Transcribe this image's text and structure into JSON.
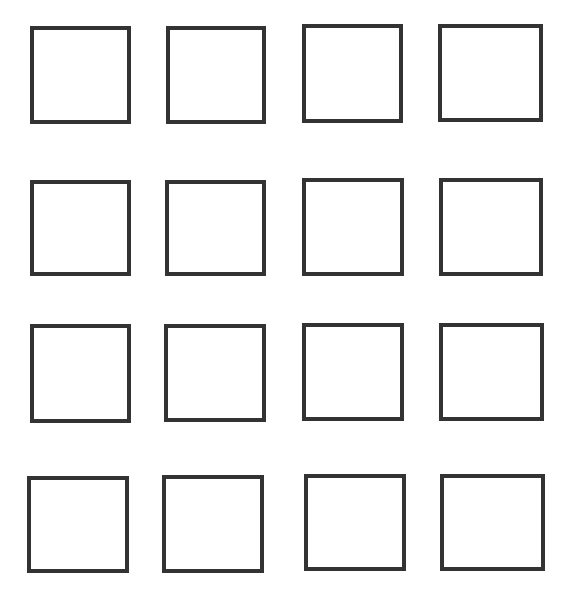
{
  "canvas": {
    "width": 573,
    "height": 591,
    "background": "#ffffff"
  },
  "grid": {
    "rows": 4,
    "columns": 4,
    "stroke_color": "#333333",
    "stroke_width": 4,
    "fill": "#ffffff"
  },
  "squares": [
    {
      "row": 1,
      "col": 1,
      "x": 30,
      "y": 26,
      "w": 101,
      "h": 98
    },
    {
      "row": 1,
      "col": 2,
      "x": 166,
      "y": 26,
      "w": 100,
      "h": 98
    },
    {
      "row": 1,
      "col": 3,
      "x": 302,
      "y": 24,
      "w": 101,
      "h": 99
    },
    {
      "row": 1,
      "col": 4,
      "x": 438,
      "y": 24,
      "w": 105,
      "h": 98
    },
    {
      "row": 2,
      "col": 1,
      "x": 30,
      "y": 180,
      "w": 101,
      "h": 96
    },
    {
      "row": 2,
      "col": 2,
      "x": 165,
      "y": 180,
      "w": 101,
      "h": 96
    },
    {
      "row": 2,
      "col": 3,
      "x": 302,
      "y": 178,
      "w": 102,
      "h": 98
    },
    {
      "row": 2,
      "col": 4,
      "x": 439,
      "y": 178,
      "w": 104,
      "h": 98
    },
    {
      "row": 3,
      "col": 1,
      "x": 30,
      "y": 324,
      "w": 101,
      "h": 99
    },
    {
      "row": 3,
      "col": 2,
      "x": 164,
      "y": 324,
      "w": 102,
      "h": 98
    },
    {
      "row": 3,
      "col": 3,
      "x": 302,
      "y": 323,
      "w": 102,
      "h": 98
    },
    {
      "row": 3,
      "col": 4,
      "x": 439,
      "y": 323,
      "w": 105,
      "h": 98
    },
    {
      "row": 4,
      "col": 1,
      "x": 27,
      "y": 476,
      "w": 102,
      "h": 97
    },
    {
      "row": 4,
      "col": 2,
      "x": 162,
      "y": 475,
      "w": 102,
      "h": 98
    },
    {
      "row": 4,
      "col": 3,
      "x": 304,
      "y": 474,
      "w": 102,
      "h": 97
    },
    {
      "row": 4,
      "col": 4,
      "x": 440,
      "y": 474,
      "w": 105,
      "h": 97
    }
  ]
}
